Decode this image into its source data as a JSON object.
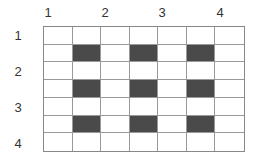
{
  "column_labels": [
    {
      "text": "1",
      "x": 48
    },
    {
      "text": "2",
      "x": 105
    },
    {
      "text": "3",
      "x": 162
    },
    {
      "text": "4",
      "x": 220
    }
  ],
  "row_labels": [
    {
      "text": "1",
      "y": 28
    },
    {
      "text": "2",
      "y": 64
    },
    {
      "text": "3",
      "y": 100
    },
    {
      "text": "4",
      "y": 136
    }
  ],
  "grid": {
    "rows": 7,
    "cols": 7,
    "dark_color": "#4a4a4a",
    "cells": [
      [
        0,
        0,
        0,
        0,
        0,
        0,
        0
      ],
      [
        0,
        1,
        0,
        1,
        0,
        1,
        0
      ],
      [
        0,
        0,
        0,
        0,
        0,
        0,
        0
      ],
      [
        0,
        1,
        0,
        1,
        0,
        1,
        0
      ],
      [
        0,
        0,
        0,
        0,
        0,
        0,
        0
      ],
      [
        0,
        1,
        0,
        1,
        0,
        1,
        0
      ],
      [
        0,
        0,
        0,
        0,
        0,
        0,
        0
      ]
    ]
  }
}
